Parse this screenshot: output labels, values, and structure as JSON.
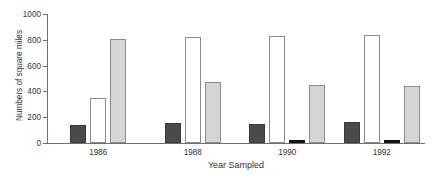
{
  "chart_data": {
    "type": "bar",
    "title": "",
    "xlabel": "Year Sampled",
    "ylabel": "Numbers of square miles",
    "categories": [
      "1986",
      "1988",
      "1990",
      "1992"
    ],
    "ylim": [
      0,
      1000
    ],
    "yticks": [
      0,
      200,
      400,
      600,
      800,
      1000
    ],
    "ytick_labels": [
      "0",
      "200",
      "400",
      "600",
      "800",
      "1000"
    ],
    "grid": false,
    "legend": "none",
    "series": [
      {
        "name": "series-1",
        "style": "dark",
        "color": "#4a4a4a",
        "values": [
          140,
          155,
          145,
          160
        ]
      },
      {
        "name": "series-2",
        "style": "white",
        "color": "#ffffff",
        "values": [
          350,
          825,
          830,
          840
        ]
      },
      {
        "name": "series-3",
        "style": "black",
        "color": "#111111",
        "values": [
          null,
          null,
          25,
          25
        ]
      },
      {
        "name": "series-4",
        "style": "gray",
        "color": "#d5d5d5",
        "values": [
          805,
          470,
          450,
          445
        ]
      }
    ]
  },
  "axis": {
    "y_title": "Numbers of square miles",
    "x_title": "Year Sampled",
    "y_ticks": [
      "1000",
      "800",
      "600",
      "400",
      "200",
      "0"
    ]
  },
  "groups": [
    {
      "label": "1986"
    },
    {
      "label": "1988"
    },
    {
      "label": "1990"
    },
    {
      "label": "1992"
    }
  ],
  "header": {
    "cropped_title": ""
  }
}
